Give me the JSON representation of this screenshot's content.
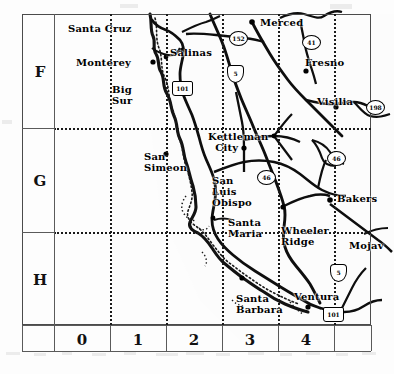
{
  "map": {
    "title": "California Central Coast index map",
    "region": "Central and Southern California",
    "grid": {
      "row_labels": [
        "F",
        "G",
        "H"
      ],
      "column_labels": [
        "0",
        "1",
        "2",
        "3",
        "4"
      ],
      "row_boundaries_px": [
        14,
        128,
        232,
        325
      ],
      "column_boundaries_px": [
        22,
        54,
        110,
        166,
        222,
        278,
        334,
        371
      ],
      "dotted_graticule": true,
      "frame_color": "#4b4b4b",
      "graticule_color": "#1a1a1a"
    },
    "places": [
      {
        "name": "Santa Cruz",
        "label": "Santa Cruz",
        "x": 68,
        "y": 28,
        "cell": "F1"
      },
      {
        "name": "Monterey",
        "label": "Monterey",
        "x": 76,
        "y": 62,
        "cell": "F1"
      },
      {
        "name": "Big Sur",
        "label": "Big\nSur",
        "x": 112,
        "y": 88,
        "cell": "F1"
      },
      {
        "name": "Salinas",
        "label": "Salinas",
        "x": 170,
        "y": 52,
        "cell": "F2"
      },
      {
        "name": "Merced",
        "label": "Merced",
        "x": 260,
        "y": 22,
        "cell": "F3"
      },
      {
        "name": "Fresno",
        "label": "Fresno",
        "x": 305,
        "y": 62,
        "cell": "F4"
      },
      {
        "name": "Visilia",
        "label": "Visilia",
        "x": 317,
        "y": 101,
        "cell": "F4"
      },
      {
        "name": "Kettleman City",
        "label": "Kettleman\n  City",
        "x": 210,
        "y": 136,
        "cell": "G3"
      },
      {
        "name": "San Simeon",
        "label": "San\nSimeon",
        "x": 146,
        "y": 156,
        "cell": "G1"
      },
      {
        "name": "San Luis Obispo",
        "label": "San\nLuis\nObispo",
        "x": 214,
        "y": 180,
        "cell": "G2"
      },
      {
        "name": "Bakersfield",
        "label": "Bakers",
        "x": 339,
        "y": 198,
        "cell": "G4"
      },
      {
        "name": "Santa Maria",
        "label": "Santa\nMaria",
        "x": 230,
        "y": 222,
        "cell": "H2"
      },
      {
        "name": "Wheeler Ridge",
        "label": "Wheeler\nRidge",
        "x": 283,
        "y": 230,
        "cell": "H3"
      },
      {
        "name": "Mojave",
        "label": "Mojav",
        "x": 351,
        "y": 245,
        "cell": "H4"
      },
      {
        "name": "Santa Barbara",
        "label": "Santa\nBarbara",
        "x": 238,
        "y": 298,
        "cell": "H2"
      },
      {
        "name": "Ventura",
        "label": "Ventura",
        "x": 296,
        "y": 296,
        "cell": "H3"
      }
    ],
    "shields": [
      {
        "route": "152",
        "type": "state",
        "x": 229,
        "y": 31,
        "label": "152"
      },
      {
        "route": "41",
        "type": "state",
        "x": 302,
        "y": 35,
        "label": "41"
      },
      {
        "route": "101",
        "type": "us",
        "x": 172,
        "y": 81,
        "label": "101"
      },
      {
        "route": "5",
        "type": "inter",
        "x": 227,
        "y": 67,
        "label": "5"
      },
      {
        "route": "198",
        "type": "state",
        "x": 368,
        "y": 100,
        "label": "198"
      },
      {
        "route": "46",
        "type": "state",
        "x": 327,
        "y": 151,
        "label": "46"
      },
      {
        "route": "46",
        "type": "state",
        "x": 257,
        "y": 170,
        "label": "46"
      },
      {
        "route": "5",
        "type": "inter",
        "x": 330,
        "y": 266,
        "label": "5"
      },
      {
        "route": "101",
        "type": "us",
        "x": 325,
        "y": 308,
        "label": "101"
      }
    ]
  }
}
